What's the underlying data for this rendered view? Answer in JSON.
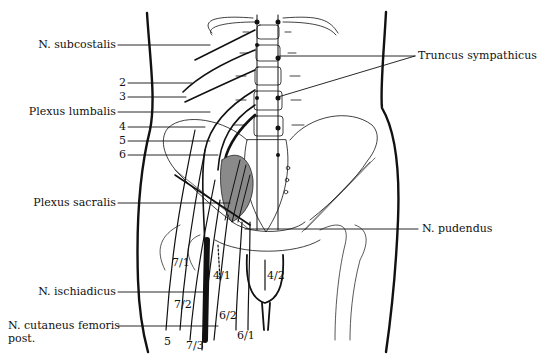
{
  "diagram": {
    "type": "anatomical-illustration",
    "labels_left": {
      "subcostalis": "N. subcostalis",
      "n2": "2",
      "n3": "3",
      "plexus_lumbalis": "Plexus lumbalis",
      "n4": "4",
      "n5": "5",
      "n6": "6",
      "plexus_sacralis": "Plexus sacralis",
      "ischiadicus": "N. ischiadicus",
      "cutaneus_1": "N. cutaneus femoris",
      "cutaneus_2": "post."
    },
    "labels_right": {
      "truncus": "Truncus sympathicus",
      "pudendus": "N. pudendus"
    },
    "labels_inline": {
      "l7_1": "7/1",
      "l7_2": "7/2",
      "l7_3": "7/3",
      "l5": "5",
      "l4_1": "4/1",
      "l4_2": "4/2",
      "l6_2": "6/2",
      "l6_1": "6/1"
    }
  }
}
